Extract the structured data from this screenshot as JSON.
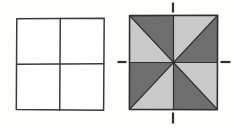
{
  "figure": {
    "title": "",
    "background_color": "#fdfdfc",
    "stroke_color": "#3a3a3a",
    "light_fill": "#c9c9c9",
    "dark_fill": "#6e6e6e",
    "panels": [
      {
        "name": "plain-grid-square",
        "label": "",
        "x": 16,
        "y": 18,
        "width": 88,
        "height": 92,
        "subdivision": "2x2",
        "fill": "#ffffff",
        "cells": [
          {
            "name": "cell-top-left",
            "fill": "#ffffff"
          },
          {
            "name": "cell-top-right",
            "fill": "#ffffff"
          },
          {
            "name": "cell-bottom-left",
            "fill": "#ffffff"
          },
          {
            "name": "cell-bottom-right",
            "fill": "#ffffff"
          }
        ]
      },
      {
        "name": "pinwheel-shaded-square",
        "label": "",
        "x": 129,
        "y": 15,
        "width": 89,
        "height": 95,
        "subdivision": "8-triangle-pinwheel",
        "triangles": [
          {
            "name": "triangle-tl-lower",
            "quadrant": "top-left",
            "half": "lower-left",
            "shade": "light"
          },
          {
            "name": "triangle-tl-upper",
            "quadrant": "top-left",
            "half": "upper-right",
            "shade": "dark"
          },
          {
            "name": "triangle-tr-upper",
            "quadrant": "top-right",
            "half": "upper-left",
            "shade": "light"
          },
          {
            "name": "triangle-tr-lower",
            "quadrant": "top-right",
            "half": "lower-right",
            "shade": "dark"
          },
          {
            "name": "triangle-bl-upper",
            "quadrant": "bottom-left",
            "half": "upper-left",
            "shade": "dark"
          },
          {
            "name": "triangle-bl-lower",
            "quadrant": "bottom-left",
            "half": "lower-right",
            "shade": "light"
          },
          {
            "name": "triangle-br-lower",
            "quadrant": "bottom-right",
            "half": "lower-left",
            "shade": "dark"
          },
          {
            "name": "triangle-br-upper",
            "quadrant": "bottom-right",
            "half": "upper-right",
            "shade": "light"
          }
        ],
        "axis_marks": [
          {
            "name": "axis-mark-top",
            "orientation": "vertical",
            "position": "top"
          },
          {
            "name": "axis-mark-bottom",
            "orientation": "vertical",
            "position": "bottom"
          },
          {
            "name": "axis-mark-left",
            "orientation": "horizontal",
            "position": "left"
          },
          {
            "name": "axis-mark-right",
            "orientation": "horizontal",
            "position": "right"
          }
        ]
      }
    ]
  }
}
